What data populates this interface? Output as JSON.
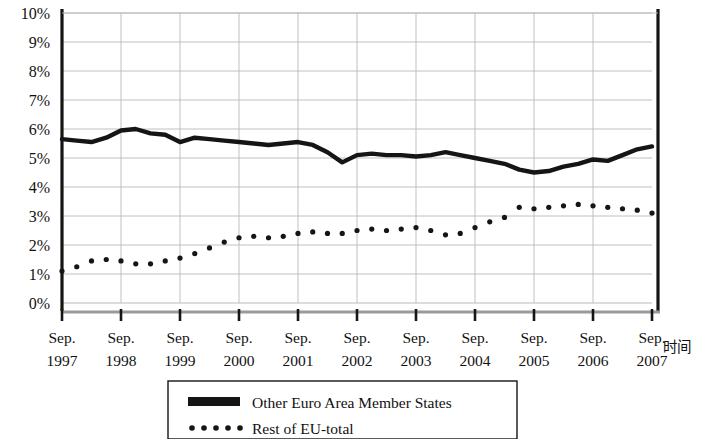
{
  "chart_data": {
    "type": "line",
    "title": "",
    "subtitle": "",
    "xlabel": "时间",
    "ylabel": "",
    "ylim": [
      0,
      10
    ],
    "ytick_values": [
      0,
      1,
      2,
      3,
      4,
      5,
      6,
      7,
      8,
      9,
      10
    ],
    "ytick_labels": [
      "0%",
      "1%",
      "2%",
      "3%",
      "4%",
      "5%",
      "6%",
      "7%",
      "8%",
      "9%",
      "10%"
    ],
    "grid": true,
    "legend_position": "bottom",
    "x_tick_labels_line1": [
      "Sep.",
      "Sep.",
      "Sep.",
      "Sep.",
      "Sep.",
      "Sep.",
      "Sep.",
      "Sep.",
      "Sep.",
      "Sep.",
      "Sep."
    ],
    "x_tick_labels_line2": [
      "1997",
      "1998",
      "1999",
      "2000",
      "2001",
      "2002",
      "2003",
      "2004",
      "2005",
      "2006",
      "2007"
    ],
    "x_major_values": [
      1997.75,
      1998.75,
      1999.75,
      2000.75,
      2001.75,
      2002.75,
      2003.75,
      2004.75,
      2005.75,
      2006.75,
      2007.75
    ],
    "xlim": [
      1997.75,
      2007.75
    ],
    "series": [
      {
        "name": "Other Euro Area Member States",
        "style": "solid-thick",
        "color": "#151515",
        "x": [
          1997.75,
          1998.0,
          1998.25,
          1998.5,
          1998.75,
          1999.0,
          1999.25,
          1999.5,
          1999.75,
          2000.0,
          2000.25,
          2000.5,
          2000.75,
          2001.0,
          2001.25,
          2001.5,
          2001.75,
          2002.0,
          2002.25,
          2002.5,
          2002.75,
          2003.0,
          2003.25,
          2003.5,
          2003.75,
          2004.0,
          2004.25,
          2004.5,
          2004.75,
          2005.0,
          2005.25,
          2005.5,
          2005.75,
          2006.0,
          2006.25,
          2006.5,
          2006.75,
          2007.0,
          2007.25,
          2007.5,
          2007.75
        ],
        "values": [
          5.65,
          5.6,
          5.55,
          5.7,
          5.95,
          6.0,
          5.85,
          5.8,
          5.55,
          5.7,
          5.65,
          5.6,
          5.55,
          5.5,
          5.45,
          5.5,
          5.55,
          5.45,
          5.2,
          4.85,
          5.1,
          5.15,
          5.1,
          5.1,
          5.05,
          5.1,
          5.2,
          5.1,
          5.0,
          4.9,
          4.8,
          4.6,
          4.5,
          4.55,
          4.7,
          4.8,
          4.95,
          4.9,
          5.1,
          5.3,
          5.4
        ]
      },
      {
        "name": "Rest of EU-total",
        "style": "dotted",
        "color": "#151515",
        "x": [
          1997.75,
          1998.0,
          1998.25,
          1998.5,
          1998.75,
          1999.0,
          1999.25,
          1999.5,
          1999.75,
          2000.0,
          2000.25,
          2000.5,
          2000.75,
          2001.0,
          2001.25,
          2001.5,
          2001.75,
          2002.0,
          2002.25,
          2002.5,
          2002.75,
          2003.0,
          2003.25,
          2003.5,
          2003.75,
          2004.0,
          2004.25,
          2004.5,
          2004.75,
          2005.0,
          2005.25,
          2005.5,
          2005.75,
          2006.0,
          2006.25,
          2006.5,
          2006.75,
          2007.0,
          2007.25,
          2007.5,
          2007.75
        ],
        "values": [
          1.1,
          1.25,
          1.45,
          1.5,
          1.45,
          1.35,
          1.35,
          1.45,
          1.55,
          1.7,
          1.9,
          2.1,
          2.25,
          2.3,
          2.25,
          2.3,
          2.4,
          2.45,
          2.4,
          2.4,
          2.5,
          2.55,
          2.5,
          2.55,
          2.6,
          2.5,
          2.35,
          2.4,
          2.6,
          2.8,
          2.95,
          3.3,
          3.25,
          3.3,
          3.35,
          3.4,
          3.35,
          3.3,
          3.25,
          3.2,
          3.1
        ]
      }
    ]
  },
  "legend": {
    "items": [
      {
        "label": "Other Euro Area Member States",
        "marker": "solid-bar-icon"
      },
      {
        "label": "Rest of EU-total",
        "marker": "dotted-bar-icon"
      }
    ]
  }
}
